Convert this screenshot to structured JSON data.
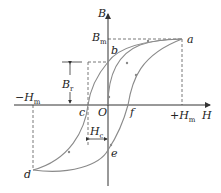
{
  "diagram": {
    "axes": {
      "x_label": "H",
      "y_label": "B",
      "origin_label": "O"
    },
    "labels": {
      "Bm": {
        "main": "B",
        "sub": "m"
      },
      "Br": {
        "main": "B",
        "sub": "r"
      },
      "Hc": {
        "main": "H",
        "sub": "c"
      },
      "neg_Hm": {
        "main": "−H",
        "sub": "m"
      },
      "pos_Hm": {
        "main": "+H",
        "sub": "m"
      },
      "a": "a",
      "b": "b",
      "c": "c",
      "d": "d",
      "e": "e",
      "f": "f"
    },
    "colors": {
      "axis": "#333333",
      "curve": "#8a8a8a",
      "dashed": "#555555",
      "background": "#ffffff"
    }
  }
}
